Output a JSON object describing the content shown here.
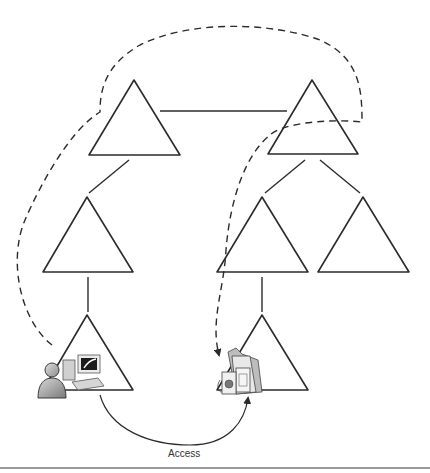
{
  "diagram": {
    "type": "hierarchy-access",
    "access_label": "Access",
    "nodes": [
      {
        "id": "root-left",
        "row": 1
      },
      {
        "id": "root-right",
        "row": 1
      },
      {
        "id": "mid-left",
        "row": 2
      },
      {
        "id": "mid-center",
        "row": 2
      },
      {
        "id": "mid-right",
        "row": 2
      },
      {
        "id": "leaf-left",
        "row": 3
      },
      {
        "id": "leaf-right",
        "row": 3
      }
    ],
    "icons": {
      "user": "user-at-computer-icon",
      "resource": "documents-folder-icon"
    },
    "colors": {
      "stroke": "#2b2b2b",
      "rule": "#9a9a9a",
      "icon_gray": "#a8a8a8"
    }
  }
}
